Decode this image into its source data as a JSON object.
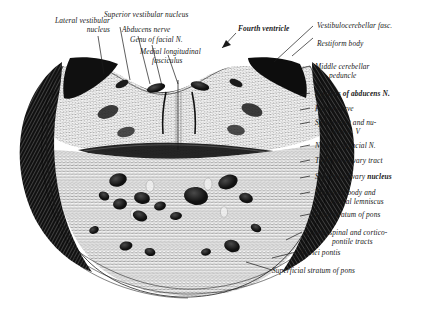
{
  "figure": {
    "medium": "engraving",
    "ink_color": "#171717",
    "paper_color": "#ffffff"
  },
  "labels": {
    "lateral_vestibular_nucleus": "Lateral vestibular",
    "lateral_vestibular_nucleus_2": "nucleus",
    "superior_vestibular_nucleus": "Superior vestibular nucleus",
    "abducens_nerve": "Abducens nerve",
    "genu_of_facial_n": "Genu of facial N.",
    "medial_longitudinal_fasciculus": "Medial longitudinal",
    "medial_longitudinal_fasciculus_2": "fasciculus",
    "fourth_ventricle": "Fourth ventricle",
    "vestibulocerebellar_fasc": "Vestibulocerebellar fasc.",
    "restiform_body": "Restiform body",
    "middle_cerebellar_peduncle": "Middle cerebellar",
    "middle_cerebellar_peduncle_2": "peduncle",
    "nucleus_of_abducens_n": "Nucleus of abducens N.",
    "facial_nerve": "Facial nerve",
    "spinal_tract_and_nucleus": "Spinal tract and nu-",
    "spinal_tract_and_nucleus_2": "cleus N. V",
    "nucleus_of_facial_n": "Nucleus of facial N.",
    "thalamo_olivary_tract": "Thalamo-olivary tract",
    "superior_olivary_nucleus_a": "Superior olivary ",
    "superior_olivary_nucleus_b": "nucleus",
    "trapezoid_body": "Trapezoid body and",
    "trapezoid_body_2": "medial lemniscus",
    "deep_stratum_of_pons": "Deep stratum of pons",
    "corticospinal_tracts": "Corticospinal and cortico-",
    "corticospinal_tracts_2": "pontile tracts",
    "nuclei_pontis": "Nuclei pontis",
    "superficial_stratum_of_pons": "Superficial stratum of pons"
  }
}
